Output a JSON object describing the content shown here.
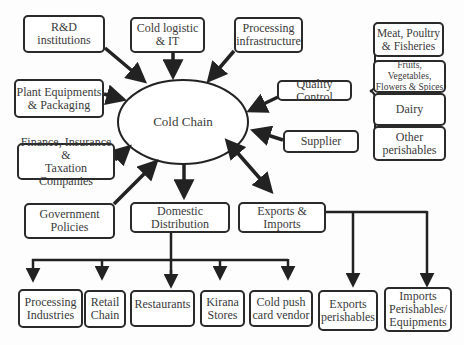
{
  "diagram": {
    "center": "Cold Chain",
    "inputs": [
      {
        "id": "rnd",
        "label": "R&D\ninstitutions"
      },
      {
        "id": "logistic",
        "label": "Cold logistic\n& IT"
      },
      {
        "id": "processing",
        "label": "Processing\ninfrastructure"
      },
      {
        "id": "plant",
        "label": "Plant Equipments\n& Packaging"
      },
      {
        "id": "quality",
        "label": "Quality Control"
      },
      {
        "id": "supplier",
        "label": "Supplier"
      },
      {
        "id": "finance",
        "label": "Finance, Insurance &\nTaxation Companies"
      },
      {
        "id": "government",
        "label": "Government\nPolicies"
      }
    ],
    "perishables": [
      {
        "id": "meat",
        "label": "Meat, Poultry\n& Fisheries"
      },
      {
        "id": "fruits",
        "label": "Fruits, Vegetables,\nFlowers & Spices"
      },
      {
        "id": "dairy",
        "label": "Dairy"
      },
      {
        "id": "other",
        "label": "Other\nperishables"
      }
    ],
    "outputs": [
      {
        "id": "domestic",
        "label": "Domestic\nDistribution"
      },
      {
        "id": "exports_imports",
        "label": "Exports &\nImports"
      }
    ],
    "domestic_children": [
      {
        "id": "proc_ind",
        "label": "Processing\nIndustries"
      },
      {
        "id": "retail",
        "label": "Retail\nChain"
      },
      {
        "id": "restaurants",
        "label": "Restaurants"
      },
      {
        "id": "kirana",
        "label": "Kirana\nStores"
      },
      {
        "id": "pushcart",
        "label": "Cold push\ncard vendor"
      }
    ],
    "trade_children": [
      {
        "id": "exp_per",
        "label": "Exports\nperishables"
      },
      {
        "id": "imp_per",
        "label": "Imports\nPerishables/\nEquipments"
      }
    ]
  }
}
